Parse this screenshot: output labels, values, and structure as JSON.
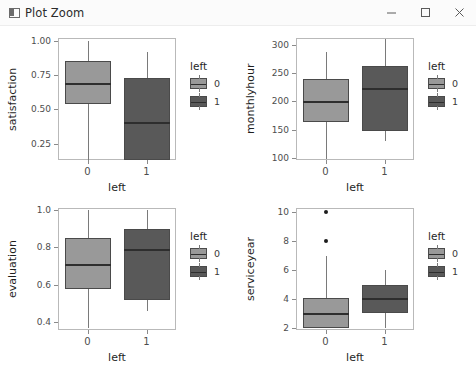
{
  "window": {
    "title": "Plot Zoom",
    "icon": "window-icon",
    "controls": {
      "minimize": "minimize-icon",
      "maximize": "maximize-icon",
      "close": "close-icon"
    }
  },
  "colors": {
    "group0": "#999999",
    "group1": "#595959",
    "median": "#2e2e2e",
    "whisker": "#7a7a7a",
    "panel_border": "#b9b9b9",
    "text": "#1f1f1f"
  },
  "legend": {
    "title": "left",
    "entries": [
      {
        "label": "0",
        "color": "#999999"
      },
      {
        "label": "1",
        "color": "#595959"
      }
    ]
  },
  "chart_data": [
    {
      "type": "box",
      "id": "satisfaction-vs-left",
      "title": "",
      "xlabel": "left",
      "ylabel": "satisfaction",
      "categories": [
        "0",
        "1"
      ],
      "ylim": [
        0.13,
        1.02
      ],
      "yticks": [
        "0.25",
        "0.50",
        "0.75",
        "1.00"
      ],
      "ytickvals": [
        0.25,
        0.5,
        0.75,
        1.0
      ],
      "grid": false,
      "legend_position": "right",
      "boxes": [
        {
          "group": "0",
          "color": "#999999",
          "min": 0.13,
          "q1": 0.54,
          "median": 0.69,
          "q3": 0.85,
          "max": 1.0,
          "outliers": []
        },
        {
          "group": "1",
          "color": "#595959",
          "min": 0.13,
          "q1": 0.13,
          "median": 0.41,
          "q3": 0.73,
          "max": 0.92,
          "outliers": []
        }
      ]
    },
    {
      "type": "box",
      "id": "monthlyhour-vs-left",
      "title": "",
      "xlabel": "left",
      "ylabel": "monthlyhour",
      "categories": [
        "0",
        "1"
      ],
      "ylim": [
        96,
        312
      ],
      "yticks": [
        "100",
        "150",
        "200",
        "250",
        "300"
      ],
      "ytickvals": [
        100,
        150,
        200,
        250,
        300
      ],
      "grid": false,
      "legend_position": "right",
      "boxes": [
        {
          "group": "0",
          "color": "#999999",
          "min": 98,
          "q1": 163,
          "median": 200,
          "q3": 239,
          "max": 287,
          "outliers": []
        },
        {
          "group": "1",
          "color": "#595959",
          "min": 129,
          "q1": 147,
          "median": 224,
          "q3": 263,
          "max": 311,
          "outliers": []
        }
      ]
    },
    {
      "type": "box",
      "id": "evaluation-vs-left",
      "title": "",
      "xlabel": "left",
      "ylabel": "evaluation",
      "categories": [
        "0",
        "1"
      ],
      "ylim": [
        0.36,
        1.01
      ],
      "yticks": [
        "0.4",
        "0.6",
        "0.8",
        "1.0"
      ],
      "ytickvals": [
        0.4,
        0.6,
        0.8,
        1.0
      ],
      "grid": false,
      "legend_position": "right",
      "boxes": [
        {
          "group": "0",
          "color": "#999999",
          "min": 0.37,
          "q1": 0.58,
          "median": 0.71,
          "q3": 0.85,
          "max": 1.0,
          "outliers": []
        },
        {
          "group": "1",
          "color": "#595959",
          "min": 0.46,
          "q1": 0.52,
          "median": 0.79,
          "q3": 0.9,
          "max": 1.0,
          "outliers": []
        }
      ]
    },
    {
      "type": "box",
      "id": "serviceyear-vs-left",
      "title": "",
      "xlabel": "left",
      "ylabel": "serviceyear",
      "categories": [
        "0",
        "1"
      ],
      "ylim": [
        1.85,
        10.3
      ],
      "yticks": [
        "2",
        "4",
        "6",
        "8",
        "10"
      ],
      "ytickvals": [
        2,
        4,
        6,
        8,
        10
      ],
      "grid": false,
      "legend_position": "right",
      "boxes": [
        {
          "group": "0",
          "color": "#999999",
          "min": 2.0,
          "q1": 2.0,
          "median": 3.0,
          "q3": 4.1,
          "max": 7.0,
          "outliers": [
            8,
            10
          ]
        },
        {
          "group": "1",
          "color": "#595959",
          "min": 2.0,
          "q1": 3.0,
          "median": 4.1,
          "q3": 5.0,
          "max": 6.0,
          "outliers": []
        }
      ]
    }
  ]
}
